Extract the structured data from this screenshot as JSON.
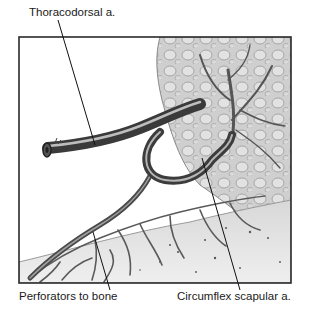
{
  "figure": {
    "labels": {
      "thoracodorsal": "Thoracodorsal a.",
      "perforators": "Perforators to bone",
      "circumflex": "Circumflex scapular a."
    },
    "colors": {
      "frame": "#2a2a2a",
      "vessel_dark": "#3a3a3a",
      "vessel_mid": "#6a6a6a",
      "vessel_light": "#a8a8a8",
      "muscle": "#c9c9c9",
      "bone": "#e6e6e6",
      "leader": "#111111"
    }
  }
}
